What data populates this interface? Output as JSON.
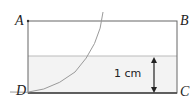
{
  "diagram": {
    "vertices": {
      "A": "A",
      "B": "B",
      "C": "C",
      "D": "D"
    },
    "measurement": "1 cm",
    "colors": {
      "outline": "#555555",
      "shaded": "#f2f2f2",
      "water_line": "#bbbbbb",
      "arc": "#999999"
    }
  }
}
